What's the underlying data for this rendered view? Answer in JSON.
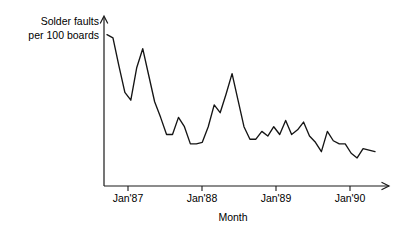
{
  "chart_data": {
    "type": "line",
    "title": "",
    "subtitle": "",
    "xlabel": "Month",
    "ylabel": "Solder faults per 100 boards",
    "ylabel_lines": [
      "Solder faults",
      "per 100 boards"
    ],
    "grid": false,
    "legend": false,
    "legend_position": "none",
    "axis_style": "arrow-ended open axes, no y-axis tick labels",
    "xlim": [
      "Oct'86",
      "Jul'90"
    ],
    "ylim": [
      0,
      100
    ],
    "tick_labels": [
      "Jan'87",
      "Jan'88",
      "Jan'89",
      "Jan'90"
    ],
    "tick_x_values": [
      "Jan'87",
      "Jan'88",
      "Jan'89",
      "Jan'90"
    ],
    "x": [
      "Oct'86",
      "Nov'86",
      "Dec'86",
      "Jan'87",
      "Feb'87",
      "Mar'87",
      "Apr'87",
      "May'87",
      "Jun'87",
      "Jul'87",
      "Aug'87",
      "Sep'87",
      "Oct'87",
      "Nov'87",
      "Dec'87",
      "Jan'88",
      "Feb'88",
      "Mar'88",
      "Apr'88",
      "May'88",
      "Jun'88",
      "Jul'88",
      "Aug'88",
      "Sep'88",
      "Oct'88",
      "Nov'88",
      "Dec'88",
      "Jan'89",
      "Feb'89",
      "Mar'89",
      "Apr'89",
      "May'89",
      "Jun'89",
      "Jul'89",
      "Aug'89",
      "Sep'89",
      "Oct'89",
      "Nov'89",
      "Dec'89",
      "Jan'90",
      "Feb'90",
      "Mar'90",
      "Apr'90",
      "May'90",
      "Jun'90",
      "Jul'90"
    ],
    "series": [
      {
        "name": "Solder faults per 100 boards",
        "color": "#151515",
        "values": [
          97,
          95,
          77,
          60,
          55,
          76,
          88,
          71,
          54,
          44,
          33,
          33,
          44,
          38,
          27,
          27,
          28,
          38,
          52,
          47,
          59,
          72,
          55,
          38,
          30,
          30,
          35,
          32,
          38,
          33,
          42,
          33,
          36,
          41,
          32,
          28,
          22,
          35,
          29,
          27,
          27,
          21,
          18,
          24,
          23,
          22
        ]
      }
    ],
    "annotations": []
  },
  "geometry": {
    "plot_left": 104,
    "plot_bottom": 186,
    "plot_top": 16,
    "plot_right": 390,
    "tick_positions": [
      128,
      202,
      276,
      350
    ],
    "series_start_x": 107,
    "series_end_x": 375
  },
  "colors": {
    "background": "#ffffff",
    "axis": "#1a1a1a",
    "series": "#151515",
    "text": "#000000"
  },
  "labels": {
    "x_axis_title": "Month",
    "y_axis_line1": "Solder faults",
    "y_axis_line2": "per 100 boards",
    "tick1": "Jan'87",
    "tick2": "Jan'88",
    "tick3": "Jan'89",
    "tick4": "Jan'90"
  }
}
